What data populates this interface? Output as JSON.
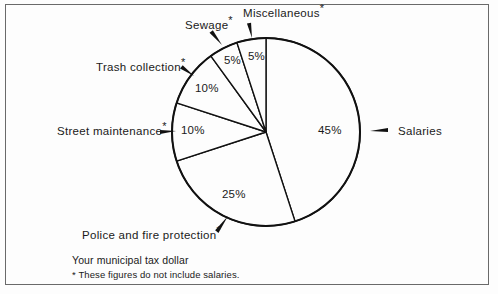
{
  "chart_data": {
    "type": "pie",
    "title": "Your municipal tax dollar",
    "footnote": "* These figures do not include salaries.",
    "start_angle_deg": 0,
    "direction": "clockwise",
    "center": {
      "x": 266,
      "y": 132
    },
    "radius": 94,
    "categories": [
      "Salaries",
      "Police and fire protection",
      "Street maintenance",
      "Trash collection",
      "Sewage",
      "Miscellaneous"
    ],
    "values": [
      45,
      25,
      10,
      10,
      5,
      5
    ],
    "unit": "%",
    "stroke_color": "#111111",
    "fill_color": "#fdfdfd",
    "slices": [
      {
        "name": "Salaries",
        "value": 45,
        "value_label": "45%",
        "label": "Salaries",
        "asterisk": false,
        "label_x": 398,
        "label_y": 126,
        "value_x": 318,
        "value_y": 125,
        "arrow": {
          "x1": 388,
          "y1": 131,
          "x2": 370,
          "y2": 131
        }
      },
      {
        "name": "Police and fire protection",
        "value": 25,
        "value_label": "25%",
        "label": "Police and fire protection",
        "asterisk": true,
        "label_x": 82,
        "label_y": 230,
        "value_x": 222,
        "value_y": 189,
        "arrow": {
          "x1": 216,
          "y1": 231,
          "x2": 228,
          "y2": 216
        }
      },
      {
        "name": "Street maintenance",
        "value": 10,
        "value_label": "10%",
        "label": "Street maintenance",
        "asterisk": true,
        "label_x": 57,
        "label_y": 126,
        "value_x": 181,
        "value_y": 125,
        "arrow": {
          "x1": 160,
          "y1": 131,
          "x2": 176,
          "y2": 131
        }
      },
      {
        "name": "Trash collection",
        "value": 10,
        "value_label": "10%",
        "label": "Trash collection",
        "asterisk": true,
        "label_x": 96,
        "label_y": 62,
        "value_x": 195,
        "value_y": 83,
        "arrow": {
          "x1": 182,
          "y1": 66,
          "x2": 194,
          "y2": 76
        }
      },
      {
        "name": "Sewage",
        "value": 5,
        "value_label": "5%",
        "label": "Sewage",
        "asterisk": true,
        "label_x": 185,
        "label_y": 20,
        "value_x": 224,
        "value_y": 55,
        "arrow": {
          "x1": 212,
          "y1": 31,
          "x2": 222,
          "y2": 45
        }
      },
      {
        "name": "Miscellaneous",
        "value": 5,
        "value_label": "5%",
        "label": "Miscellaneous",
        "asterisk": true,
        "label_x": 243,
        "label_y": 8,
        "value_x": 248,
        "value_y": 51,
        "arrow": {
          "x1": 250,
          "y1": 23,
          "x2": 252,
          "y2": 38
        }
      }
    ]
  },
  "caption": {
    "line1": "Your municipal tax dollar",
    "line2_marker": "*",
    "line2": " These figures do not include salaries."
  },
  "labels": {
    "salaries": "Salaries",
    "police": "Police and fire protection",
    "street": "Street maintenance",
    "trash": "Trash collection",
    "sewage": "Sewage",
    "misc": "Miscellaneous",
    "asterisk": "*",
    "pct_salaries": "45%",
    "pct_police": "25%",
    "pct_street": "10%",
    "pct_trash": "10%",
    "pct_sewage": "5%",
    "pct_misc": "5%"
  }
}
